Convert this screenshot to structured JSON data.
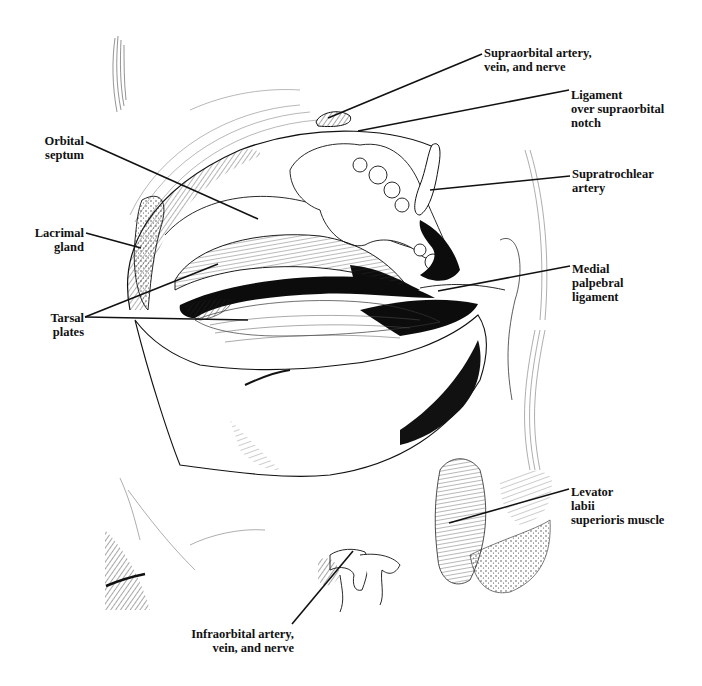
{
  "figure": {
    "style": "pen-and-ink anatomical illustration",
    "colors": {
      "ink": "#111111",
      "background": "#ffffff"
    }
  },
  "labels": [
    {
      "id": "supraorbital",
      "lines": [
        "Supraorbital artery,",
        "vein, and nerve"
      ],
      "x": 484,
      "y": 46,
      "align": "left",
      "leader": {
        "x1": 482,
        "y1": 54,
        "x2": 328,
        "y2": 118
      }
    },
    {
      "id": "ligament-notch",
      "lines": [
        "Ligament",
        "over supraorbital",
        "notch"
      ],
      "x": 571,
      "y": 88,
      "align": "left",
      "leader": {
        "x1": 569,
        "y1": 90,
        "x2": 358,
        "y2": 131
      }
    },
    {
      "id": "orbital-septum",
      "lines": [
        "Orbital",
        "septum"
      ],
      "x": 40,
      "y": 134,
      "align": "right",
      "right_edge": 84,
      "leader": {
        "x1": 86,
        "y1": 142,
        "x2": 258,
        "y2": 219
      }
    },
    {
      "id": "supratrochlear",
      "lines": [
        "Supratrochlear",
        "artery"
      ],
      "x": 572,
      "y": 167,
      "align": "left",
      "leader": {
        "x1": 570,
        "y1": 176,
        "x2": 430,
        "y2": 190
      }
    },
    {
      "id": "lacrimal-gland",
      "lines": [
        "Lacrimal",
        "gland"
      ],
      "x": 32,
      "y": 226,
      "align": "right",
      "right_edge": 84,
      "leader": {
        "x1": 86,
        "y1": 233,
        "x2": 141,
        "y2": 248
      }
    },
    {
      "id": "medial-palpebral",
      "lines": [
        "Medial",
        "palpebral",
        "ligament"
      ],
      "x": 572,
      "y": 262,
      "align": "left",
      "leader": {
        "x1": 570,
        "y1": 266,
        "x2": 438,
        "y2": 291
      }
    },
    {
      "id": "tarsal-plates",
      "lines": [
        "Tarsal",
        "plates"
      ],
      "x": 40,
      "y": 311,
      "align": "right",
      "right_edge": 84,
      "leaders": [
        {
          "x1": 85,
          "y1": 317,
          "x2": 218,
          "y2": 264
        },
        {
          "x1": 85,
          "y1": 317,
          "x2": 248,
          "y2": 320
        }
      ]
    },
    {
      "id": "levator-labii",
      "lines": [
        "Levator",
        "labii",
        "superioris muscle"
      ],
      "x": 571,
      "y": 485,
      "align": "left",
      "leader": {
        "x1": 569,
        "y1": 489,
        "x2": 449,
        "y2": 523
      }
    },
    {
      "id": "infraorbital",
      "lines": [
        "Infraorbital artery,",
        "vein, and nerve"
      ],
      "x": 190,
      "y": 627,
      "align": "right",
      "right_edge": 294,
      "leader": {
        "x1": 292,
        "y1": 624,
        "x2": 353,
        "y2": 551
      }
    }
  ]
}
